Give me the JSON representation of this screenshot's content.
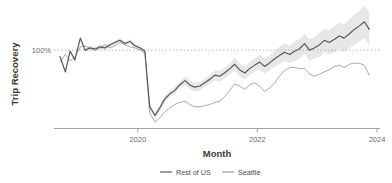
{
  "chart_data": {
    "type": "line",
    "title": "",
    "subtitle": "",
    "xlabel": "Month",
    "ylabel": "Trip Recovery",
    "xlim": [
      2018.6,
      2024.05
    ],
    "ylim": [
      0.28,
      1.35
    ],
    "grid": false,
    "x_tick_labels": [
      "2020",
      "2022",
      "2024"
    ],
    "x_tick_values": [
      2020,
      2022,
      2024
    ],
    "y_tick_labels": [
      "100%"
    ],
    "y_tick_values": [
      1.0
    ],
    "reference_line": {
      "value": 1.0,
      "label": "100%",
      "style": "dotted",
      "color": "#b0b0b0"
    },
    "legend": {
      "position": "bottom-center",
      "entries": [
        {
          "name": "Rest of US",
          "color": "#555555"
        },
        {
          "name": "Seattle",
          "color": "#9a9a9a"
        }
      ]
    },
    "band": {
      "series": "Rest of US",
      "color": "#e6e6e6",
      "description": "confidence interval ribbon around Rest of US"
    },
    "x": [
      2018.7,
      2018.79,
      2018.87,
      2018.95,
      2019.04,
      2019.12,
      2019.2,
      2019.29,
      2019.37,
      2019.45,
      2019.54,
      2019.62,
      2019.7,
      2019.79,
      2019.87,
      2019.95,
      2020.04,
      2020.12,
      2020.2,
      2020.29,
      2020.37,
      2020.45,
      2020.54,
      2020.62,
      2020.7,
      2020.79,
      2020.87,
      2020.95,
      2021.04,
      2021.12,
      2021.2,
      2021.29,
      2021.37,
      2021.45,
      2021.54,
      2021.62,
      2021.7,
      2021.79,
      2021.87,
      2021.95,
      2022.04,
      2022.12,
      2022.2,
      2022.29,
      2022.37,
      2022.45,
      2022.54,
      2022.62,
      2022.7,
      2022.79,
      2022.87,
      2022.95,
      2023.04,
      2023.12,
      2023.2,
      2023.29,
      2023.37,
      2023.45,
      2023.54,
      2023.62,
      2023.7,
      2023.79,
      2023.87
    ],
    "series": [
      {
        "name": "Rest of US",
        "color": "#555555",
        "values": [
          0.94,
          0.8,
          0.99,
          0.91,
          1.11,
          1.0,
          1.02,
          1.01,
          1.03,
          1.02,
          1.05,
          1.07,
          1.09,
          1.06,
          1.08,
          1.04,
          1.02,
          0.99,
          0.48,
          0.4,
          0.47,
          0.55,
          0.6,
          0.63,
          0.68,
          0.72,
          0.68,
          0.66,
          0.67,
          0.7,
          0.73,
          0.77,
          0.76,
          0.79,
          0.83,
          0.87,
          0.82,
          0.79,
          0.83,
          0.86,
          0.89,
          0.85,
          0.88,
          0.92,
          0.95,
          0.98,
          0.96,
          0.99,
          1.01,
          1.06,
          1.0,
          1.02,
          1.05,
          1.09,
          1.07,
          1.1,
          1.13,
          1.11,
          1.15,
          1.19,
          1.22,
          1.26,
          1.19
        ],
        "band_lower": [
          0.92,
          0.78,
          0.97,
          0.89,
          1.09,
          0.98,
          1.0,
          0.99,
          1.01,
          1.0,
          1.03,
          1.05,
          1.07,
          1.04,
          1.06,
          1.02,
          1.0,
          0.97,
          0.45,
          0.37,
          0.44,
          0.52,
          0.57,
          0.6,
          0.65,
          0.68,
          0.64,
          0.62,
          0.63,
          0.66,
          0.69,
          0.72,
          0.71,
          0.74,
          0.78,
          0.81,
          0.76,
          0.73,
          0.77,
          0.8,
          0.82,
          0.78,
          0.81,
          0.85,
          0.87,
          0.9,
          0.88,
          0.9,
          0.92,
          0.97,
          0.9,
          0.92,
          0.94,
          0.98,
          0.96,
          0.98,
          1.01,
          0.98,
          1.02,
          1.05,
          1.08,
          1.11,
          1.04
        ],
        "band_upper": [
          0.96,
          0.82,
          1.01,
          0.93,
          1.13,
          1.02,
          1.04,
          1.03,
          1.05,
          1.04,
          1.07,
          1.09,
          1.11,
          1.08,
          1.1,
          1.06,
          1.04,
          1.01,
          0.51,
          0.43,
          0.5,
          0.58,
          0.63,
          0.66,
          0.71,
          0.76,
          0.72,
          0.7,
          0.71,
          0.74,
          0.77,
          0.82,
          0.81,
          0.84,
          0.88,
          0.93,
          0.88,
          0.85,
          0.89,
          0.92,
          0.96,
          0.92,
          0.95,
          0.99,
          1.03,
          1.06,
          1.04,
          1.08,
          1.1,
          1.15,
          1.1,
          1.12,
          1.16,
          1.2,
          1.18,
          1.22,
          1.25,
          1.24,
          1.28,
          1.33,
          1.36,
          1.41,
          1.34
        ]
      },
      {
        "name": "Seattle",
        "color": "#9a9a9a",
        "values": [
          0.89,
          0.96,
          0.9,
          0.94,
          1.03,
          1.04,
          1.02,
          1.0,
          1.02,
          1.05,
          1.02,
          1.04,
          1.07,
          1.05,
          1.03,
          1.02,
          1.0,
          0.97,
          0.42,
          0.34,
          0.38,
          0.43,
          0.47,
          0.5,
          0.52,
          0.53,
          0.5,
          0.48,
          0.48,
          0.49,
          0.5,
          0.52,
          0.53,
          0.57,
          0.63,
          0.69,
          0.67,
          0.64,
          0.68,
          0.7,
          0.67,
          0.62,
          0.65,
          0.7,
          0.76,
          0.81,
          0.84,
          0.84,
          0.83,
          0.83,
          0.78,
          0.76,
          0.78,
          0.8,
          0.82,
          0.85,
          0.86,
          0.84,
          0.87,
          0.88,
          0.88,
          0.86,
          0.77
        ]
      }
    ]
  },
  "axes": {
    "y_title": "Trip Recovery",
    "x_title": "Month",
    "y_tick_100": "100%",
    "x_tick_2020": "2020",
    "x_tick_2022": "2022",
    "x_tick_2024": "2024"
  },
  "legend": {
    "rest_of_us": "Rest of US",
    "seattle": "Seattle"
  }
}
